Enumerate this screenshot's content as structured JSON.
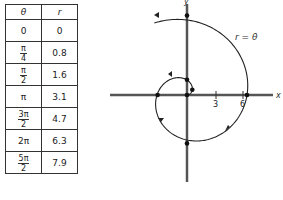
{
  "table": {
    "headers": [
      "θ",
      "r"
    ],
    "rows": [
      {
        "theta": "0",
        "theta_num": "",
        "theta_den": "",
        "r": "0"
      },
      {
        "theta": "",
        "theta_num": "π",
        "theta_den": "4",
        "r": "0.8"
      },
      {
        "theta": "",
        "theta_num": "π",
        "theta_den": "2",
        "r": "1.6"
      },
      {
        "theta": "π",
        "theta_num": "",
        "theta_den": "",
        "r": "3.1"
      },
      {
        "theta": "",
        "theta_num": "3π",
        "theta_den": "2",
        "r": "4.7"
      },
      {
        "theta": "2π",
        "theta_num": "",
        "theta_den": "",
        "r": "6.3"
      },
      {
        "theta": "",
        "theta_num": "5π",
        "theta_den": "2",
        "r": "7.9"
      }
    ]
  },
  "graph": {
    "x_label": "x",
    "y_label": "y",
    "curve_label": "r = θ",
    "ticks": [
      "3",
      "6"
    ]
  },
  "chart_data": {
    "type": "line",
    "title": "",
    "curve": "r = θ (Archimedean spiral, polar)",
    "theta": [
      0,
      0.785,
      1.571,
      3.142,
      4.712,
      6.283,
      7.854
    ],
    "r": [
      0,
      0.8,
      1.6,
      3.1,
      4.7,
      6.3,
      7.9
    ],
    "xlabel": "x",
    "ylabel": "y",
    "x_ticks": [
      3,
      6
    ],
    "grid": false
  }
}
